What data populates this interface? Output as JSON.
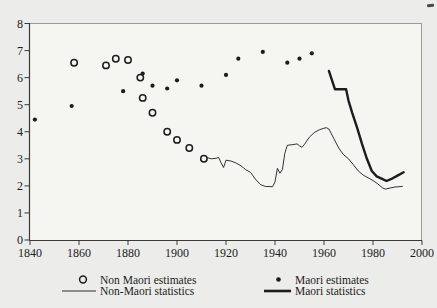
{
  "chart_data": {
    "type": "line",
    "title": "",
    "xlabel": "",
    "ylabel": "",
    "xlim": [
      1840,
      2000
    ],
    "ylim": [
      0,
      8
    ],
    "x_ticks": [
      "1840",
      "1860",
      "1880",
      "1900",
      "1920",
      "1940",
      "1960",
      "1980",
      "2000"
    ],
    "y_ticks": [
      "0",
      "1",
      "2",
      "3",
      "4",
      "5",
      "6",
      "7",
      "8"
    ],
    "grid": false,
    "legend_position": "bottom",
    "series": [
      {
        "name": "Non Maori estimates",
        "type": "scatter",
        "marker": "open-circle",
        "points": [
          [
            1858,
            6.55
          ],
          [
            1871,
            6.45
          ],
          [
            1875,
            6.7
          ],
          [
            1880,
            6.65
          ],
          [
            1885,
            6.0
          ],
          [
            1886,
            5.25
          ],
          [
            1890,
            4.7
          ],
          [
            1896,
            4.0
          ],
          [
            1900,
            3.7
          ],
          [
            1905,
            3.4
          ],
          [
            1911,
            3.0
          ]
        ]
      },
      {
        "name": "Maori estimates",
        "type": "scatter",
        "marker": "filled-circle",
        "points": [
          [
            1842,
            4.45
          ],
          [
            1857,
            4.95
          ],
          [
            1878,
            5.5
          ],
          [
            1886,
            6.15
          ],
          [
            1890,
            5.7
          ],
          [
            1896,
            5.6
          ],
          [
            1900,
            5.9
          ],
          [
            1910,
            5.7
          ],
          [
            1920,
            6.1
          ],
          [
            1925,
            6.7
          ],
          [
            1935,
            6.95
          ],
          [
            1945,
            6.55
          ],
          [
            1950,
            6.7
          ],
          [
            1955,
            6.9
          ]
        ]
      },
      {
        "name": "Non-Maori statistics",
        "type": "line",
        "style": "thin",
        "points": [
          [
            1912,
            3.05
          ],
          [
            1914,
            3.0
          ],
          [
            1916,
            3.02
          ],
          [
            1917,
            3.05
          ],
          [
            1918,
            2.85
          ],
          [
            1919,
            2.68
          ],
          [
            1920,
            2.95
          ],
          [
            1922,
            2.92
          ],
          [
            1924,
            2.85
          ],
          [
            1926,
            2.75
          ],
          [
            1928,
            2.6
          ],
          [
            1930,
            2.5
          ],
          [
            1932,
            2.25
          ],
          [
            1934,
            2.05
          ],
          [
            1936,
            1.98
          ],
          [
            1939,
            1.97
          ],
          [
            1940,
            2.15
          ],
          [
            1941,
            2.65
          ],
          [
            1942,
            2.47
          ],
          [
            1943,
            2.6
          ],
          [
            1944,
            3.2
          ],
          [
            1945,
            3.5
          ],
          [
            1947,
            3.52
          ],
          [
            1949,
            3.55
          ],
          [
            1950,
            3.48
          ],
          [
            1951,
            3.42
          ],
          [
            1952,
            3.53
          ],
          [
            1954,
            3.8
          ],
          [
            1956,
            3.97
          ],
          [
            1958,
            4.07
          ],
          [
            1960,
            4.13
          ],
          [
            1961,
            4.15
          ],
          [
            1962,
            4.1
          ],
          [
            1964,
            3.75
          ],
          [
            1966,
            3.4
          ],
          [
            1968,
            3.15
          ],
          [
            1970,
            3.0
          ],
          [
            1972,
            2.78
          ],
          [
            1974,
            2.55
          ],
          [
            1976,
            2.4
          ],
          [
            1978,
            2.3
          ],
          [
            1980,
            2.2
          ],
          [
            1982,
            2.07
          ],
          [
            1984,
            1.92
          ],
          [
            1985,
            1.88
          ],
          [
            1987,
            1.92
          ],
          [
            1989,
            1.96
          ],
          [
            1992,
            1.98
          ]
        ]
      },
      {
        "name": "Maori statistics",
        "type": "line",
        "style": "thick",
        "points": [
          [
            1962,
            6.25
          ],
          [
            1964.5,
            5.57
          ],
          [
            1969,
            5.57
          ],
          [
            1970,
            5.15
          ],
          [
            1971.5,
            4.7
          ],
          [
            1973.5,
            4.15
          ],
          [
            1975.5,
            3.55
          ],
          [
            1977.5,
            3.0
          ],
          [
            1979.5,
            2.55
          ],
          [
            1981.5,
            2.35
          ],
          [
            1983.5,
            2.27
          ],
          [
            1985.5,
            2.18
          ],
          [
            1988,
            2.28
          ],
          [
            1990,
            2.38
          ],
          [
            1992.5,
            2.5
          ]
        ]
      }
    ],
    "colors": {
      "ink": "#1c1c1c",
      "frame": "#9a9a96",
      "plot_bg": "#f5f5f2",
      "page_bg": "#ecedea"
    }
  },
  "legend": {
    "items": [
      {
        "label": "Non Maori estimates",
        "marker": "open-circle"
      },
      {
        "label": "Non-Maori statistics",
        "marker": "thin-line"
      },
      {
        "label": "Maori estimates",
        "marker": "filled-circle"
      },
      {
        "label": "Maori statistics",
        "marker": "thick-line"
      }
    ]
  },
  "artifact": {
    "name": "ink-smudge"
  }
}
